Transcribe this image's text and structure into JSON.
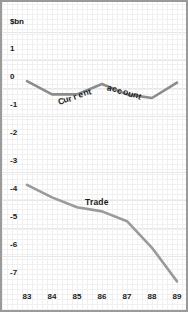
{
  "chart_data": {
    "type": "line",
    "title": "",
    "subtitle": "",
    "unit_label": "$bn",
    "xlabel": "",
    "ylabel": "$bn",
    "grid": true,
    "legend": "inline-annotations",
    "x": [
      "83",
      "84",
      "85",
      "86",
      "87",
      "88",
      "89"
    ],
    "xlim": [
      83,
      89
    ],
    "ylim": [
      -7.4,
      1.7
    ],
    "yticks": [
      "1",
      "0",
      "-1",
      "-2",
      "-3",
      "-4",
      "-5",
      "-6",
      "-7"
    ],
    "ytick_values": [
      1,
      0,
      -1,
      -2,
      -3,
      -4,
      -5,
      -6,
      -7
    ],
    "series": [
      {
        "name": "Current account",
        "color": "#8c8c8c",
        "values": [
          -0.15,
          -0.62,
          -0.62,
          -0.25,
          -0.62,
          -0.75,
          -0.2
        ]
      },
      {
        "name": "Trade",
        "color": "#9a9a9a",
        "values": [
          -3.85,
          -4.3,
          -4.65,
          -4.8,
          -5.15,
          -6.1,
          -7.3
        ]
      }
    ],
    "annotations": [
      {
        "text": "Current  account",
        "series": "Current account"
      },
      {
        "text": "Trade",
        "series": "Trade"
      }
    ]
  },
  "axis": {
    "y_ticks": [
      {
        "label": "1",
        "y": 49
      },
      {
        "label": "0",
        "y": 77
      },
      {
        "label": "-1",
        "y": 105
      },
      {
        "label": "-2",
        "y": 133
      },
      {
        "label": "-3",
        "y": 161
      },
      {
        "label": "-4",
        "y": 189
      },
      {
        "label": "-5",
        "y": 217
      },
      {
        "label": "-6",
        "y": 245
      },
      {
        "label": "-7",
        "y": 273
      }
    ],
    "x_ticks": [
      {
        "label": "83",
        "x": 27
      },
      {
        "label": "84",
        "x": 52
      },
      {
        "label": "85",
        "x": 77
      },
      {
        "label": "86",
        "x": 102
      },
      {
        "label": "87",
        "x": 127
      },
      {
        "label": "88",
        "x": 152
      },
      {
        "label": "89",
        "x": 177
      }
    ]
  },
  "annotations": {
    "current_account_parts": [
      "C",
      "u",
      "r",
      "r",
      "e",
      "n",
      "t",
      " ",
      " ",
      "a",
      "c",
      "c",
      "o",
      "u",
      "n",
      "t"
    ],
    "current_account": "Current  account",
    "trade": "Trade"
  },
  "colors": {
    "line": "#8c8c8c",
    "grid_minor": "#f0f0f0",
    "grid_major": "#e6e6e6",
    "text": "#1a1a1a",
    "background": "#ffffff",
    "frame": "#9a9a9a"
  }
}
